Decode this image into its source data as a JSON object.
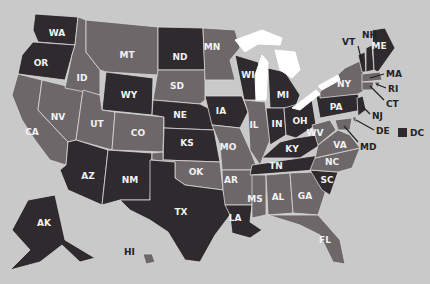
{
  "map": {
    "colors": {
      "background": "#c9c9c9",
      "dark": "#2e2a2d",
      "medium": "#6d676a",
      "lake": "#ffffff",
      "border": "#d8d8d8"
    },
    "states": [
      {
        "code": "WA",
        "shade": "dark",
        "label": [
          57,
          33
        ],
        "pts": "35,14 78,17 75,45 38,42 33,30"
      },
      {
        "code": "OR",
        "shade": "dark",
        "label": [
          41,
          63
        ],
        "pts": "33,42 75,45 72,55 65,80 18,74 22,55"
      },
      {
        "code": "CA",
        "shade": "medium",
        "label": [
          32,
          132
        ],
        "pts": "18,74 42,80 38,110 68,142 66,165 50,160 35,140 22,120 12,95"
      },
      {
        "code": "NV",
        "shade": "medium",
        "label": [
          58,
          117
        ],
        "pts": "42,80 83,90 76,140 68,142 38,110"
      },
      {
        "code": "ID",
        "shade": "medium",
        "label": [
          82,
          78
        ],
        "pts": "78,17 86,20 86,52 100,70 100,95 65,88 72,55 75,45"
      },
      {
        "code": "MT",
        "shade": "medium",
        "label": [
          127,
          55
        ],
        "pts": "86,20 158,27 158,75 106,72 100,70 86,52"
      },
      {
        "code": "WY",
        "shade": "dark",
        "label": [
          129,
          95
        ],
        "pts": "106,72 153,78 152,115 102,110"
      },
      {
        "code": "UT",
        "shade": "medium",
        "label": [
          97,
          124
        ],
        "pts": "83,90 100,95 102,110 115,112 112,150 76,140"
      },
      {
        "code": "CO",
        "shade": "medium",
        "label": [
          138,
          133
        ],
        "pts": "115,112 164,117 163,152 112,150"
      },
      {
        "code": "AZ",
        "shade": "dark",
        "label": [
          88,
          176
        ],
        "pts": "76,140 108,150 102,205 68,190 60,170 66,165 68,142"
      },
      {
        "code": "NM",
        "shade": "dark",
        "label": [
          130,
          180
        ],
        "pts": "108,150 152,153 150,200 120,200 102,205"
      },
      {
        "code": "ND",
        "shade": "dark",
        "label": [
          180,
          57
        ],
        "pts": "158,27 203,28 205,70 158,70"
      },
      {
        "code": "SD",
        "shade": "medium",
        "label": [
          177,
          86
        ],
        "pts": "158,70 205,70 205,100 200,104 153,100"
      },
      {
        "code": "NE",
        "shade": "dark",
        "label": [
          180,
          115
        ],
        "pts": "153,100 200,104 212,110 214,130 164,128 164,117 152,115"
      },
      {
        "code": "KS",
        "shade": "dark",
        "label": [
          187,
          143
        ],
        "pts": "164,128 214,130 220,162 163,160"
      },
      {
        "code": "OK",
        "shade": "medium",
        "label": [
          196,
          172
        ],
        "pts": "152,153 163,152 163,160 220,162 223,190 185,185 175,178 175,162 152,160"
      },
      {
        "code": "TX",
        "shade": "dark",
        "label": [
          181,
          212
        ],
        "pts": "150,160 175,162 175,178 185,185 223,190 230,215 215,235 200,262 185,260 168,232 150,220 130,210 120,200 150,200"
      },
      {
        "code": "MN",
        "shade": "medium",
        "label": [
          212,
          47
        ],
        "pts": "203,28 235,30 240,48 230,60 235,80 205,80"
      },
      {
        "code": "IA",
        "shade": "dark",
        "label": [
          221,
          111
        ],
        "pts": "205,96 242,96 248,112 240,128 212,125"
      },
      {
        "code": "MO",
        "shade": "medium",
        "label": [
          228,
          147
        ],
        "pts": "212,125 240,128 250,150 258,170 222,170 220,145"
      },
      {
        "code": "AR",
        "shade": "medium",
        "label": [
          231,
          180
        ],
        "pts": "222,170 256,170 252,205 225,205 223,190"
      },
      {
        "code": "LA",
        "shade": "dark",
        "label": [
          235,
          218
        ],
        "pts": "225,205 252,205 250,222 262,230 250,238 232,233 230,215"
      },
      {
        "code": "WI",
        "shade": "dark",
        "label": [
          248,
          75
        ],
        "pts": "235,55 258,62 265,80 262,100 244,100 240,80"
      },
      {
        "code": "IL",
        "shade": "medium",
        "label": [
          254,
          125
        ],
        "pts": "244,100 265,102 270,140 260,165 250,150 248,112"
      },
      {
        "code": "MI",
        "shade": "dark",
        "label": [
          283,
          95
        ],
        "pts": "268,68 285,72 300,95 295,108 270,108"
      },
      {
        "code": "IN",
        "shade": "dark",
        "label": [
          277,
          124
        ],
        "pts": "266,108 284,108 286,135 270,145"
      },
      {
        "code": "OH",
        "shade": "dark",
        "label": [
          300,
          121
        ],
        "pts": "284,108 312,100 316,125 296,138 286,135"
      },
      {
        "code": "KY",
        "shade": "dark",
        "label": [
          292,
          149
        ],
        "pts": "262,158 280,142 296,138 316,135 320,145 300,158"
      },
      {
        "code": "TN",
        "shade": "dark",
        "label": [
          276,
          166
        ],
        "pts": "252,165 320,155 315,170 250,175"
      },
      {
        "code": "MS",
        "shade": "medium",
        "label": [
          255,
          199
        ],
        "pts": "252,175 266,175 266,215 252,218"
      },
      {
        "code": "AL",
        "shade": "medium",
        "label": [
          278,
          197
        ],
        "pts": "266,175 290,173 293,213 268,215"
      },
      {
        "code": "GA",
        "shade": "medium",
        "label": [
          305,
          196
        ],
        "pts": "290,173 315,172 326,190 318,215 293,213"
      },
      {
        "code": "FL",
        "shade": "medium",
        "label": [
          325,
          240
        ],
        "pts": "268,215 318,215 340,240 345,264 333,262 320,235 300,225"
      },
      {
        "code": "SC",
        "shade": "dark",
        "label": [
          327,
          180
        ],
        "pts": "310,170 338,172 330,195 322,190"
      },
      {
        "code": "NC",
        "shade": "medium",
        "label": [
          332,
          162
        ],
        "pts": "315,158 360,148 352,168 338,172 310,170"
      },
      {
        "code": "VA",
        "shade": "medium",
        "label": [
          340,
          145
        ],
        "pts": "318,145 338,130 350,135 360,148 315,158"
      },
      {
        "code": "WV",
        "shade": "medium",
        "label": [
          315,
          133
        ],
        "pts": "312,125 330,120 336,130 318,145"
      },
      {
        "code": "PA",
        "shade": "dark",
        "label": [
          336,
          107
        ],
        "pts": "316,96 358,94 362,110 320,118"
      },
      {
        "code": "NY",
        "shade": "medium",
        "label": [
          344,
          84
        ],
        "pts": "320,92 345,68 362,60 365,90 358,94 320,98"
      },
      {
        "code": "VT",
        "shade": "dark",
        "label": [
          0,
          0
        ],
        "pts": "358,55 365,52 366,72 362,72"
      },
      {
        "code": "NH",
        "shade": "dark",
        "label": [
          0,
          0
        ],
        "pts": "366,48 372,45 374,70 366,72"
      },
      {
        "code": "ME",
        "shade": "dark",
        "label": [
          379,
          46
        ],
        "pts": "372,30 385,28 395,48 378,72 374,70"
      },
      {
        "code": "MA",
        "shade": "medium",
        "label": [
          0,
          0
        ],
        "pts": "362,74 380,72 382,80 362,82"
      },
      {
        "code": "RI",
        "shade": "medium",
        "label": [
          0,
          0
        ],
        "pts": "374,82 380,82 378,88"
      },
      {
        "code": "CT",
        "shade": "medium",
        "label": [
          0,
          0
        ],
        "pts": "362,82 374,82 372,90 362,90"
      },
      {
        "code": "NJ",
        "shade": "dark",
        "label": [
          0,
          0
        ],
        "pts": "357,98 363,96 366,110 358,116"
      },
      {
        "code": "DE",
        "shade": "medium",
        "label": [
          0,
          0
        ],
        "pts": "352,118 356,116 356,124"
      },
      {
        "code": "MD",
        "shade": "medium",
        "label": [
          0,
          0
        ],
        "pts": "335,120 352,118 350,130 338,130"
      },
      {
        "code": "AK",
        "shade": "dark",
        "label": [
          44,
          223
        ],
        "pts": "28,200 55,195 65,240 95,258 80,262 62,245 40,262 10,270 30,250 12,230 20,215"
      },
      {
        "code": "HI",
        "shade": "medium",
        "label": [
          0,
          0
        ],
        "pts": "143,254 152,254 155,262 146,264"
      }
    ],
    "outside_labels": [
      {
        "code": "VT",
        "x": 342,
        "y": 42,
        "line": [
          358,
          46,
          362,
          62
        ]
      },
      {
        "code": "NH",
        "x": 362,
        "y": 35,
        "line": [
          0,
          0,
          0,
          0
        ]
      },
      {
        "code": "MA",
        "x": 386,
        "y": 74,
        "line": [
          370,
          78,
          384,
          74
        ]
      },
      {
        "code": "RI",
        "x": 388,
        "y": 89,
        "line": [
          376,
          84,
          386,
          88
        ]
      },
      {
        "code": "CT",
        "x": 386,
        "y": 104,
        "line": [
          370,
          86,
          384,
          100
        ]
      },
      {
        "code": "NJ",
        "x": 372,
        "y": 116,
        "line": [
          362,
          106,
          370,
          114
        ]
      },
      {
        "code": "DE",
        "x": 376,
        "y": 131,
        "line": [
          356,
          120,
          374,
          130
        ]
      },
      {
        "code": "MD",
        "x": 360,
        "y": 147,
        "line": [
          344,
          126,
          358,
          142
        ]
      },
      {
        "code": "HI",
        "x": 124,
        "y": 252,
        "line": [
          0,
          0,
          0,
          0
        ]
      }
    ],
    "legend": {
      "label": "DC",
      "swatch_shade": "dark",
      "x": 398,
      "y": 133
    }
  }
}
